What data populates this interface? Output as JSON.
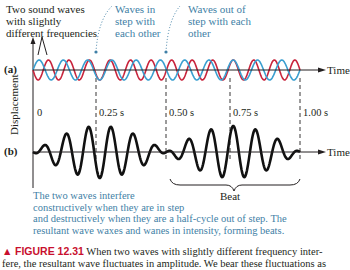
{
  "labels": {
    "two_waves": [
      "Two sound waves",
      "with slightly",
      "different frequencies"
    ],
    "in_step": [
      "Waves in",
      "step with",
      "each other"
    ],
    "out_of_step": [
      "Waves out of",
      "step with each",
      "other"
    ],
    "panel_a": "(a)",
    "panel_b": "(b)",
    "y_axis": "Displacement",
    "time_a": "Time",
    "time_b": "Time",
    "beat": "Beat",
    "ticks": [
      "0",
      "0.25 s",
      "0.50 s",
      "0.75 s",
      "1.00 s"
    ],
    "explanation": [
      "The two waves interfere",
      "constructively when they are in step",
      "and destructively when they are a half-cycle out of step.  The",
      "resultant wave waxes and wanes in intensity, forming beats."
    ]
  },
  "caption": {
    "marker": "▲",
    "figure_label": "FIGURE 12.31",
    "text_line1": "When two waves with slightly different frequency inter-",
    "text_line2": "fere, the resultant wave fluctuates in amplitude. We bear these fluctuations as"
  },
  "colors": {
    "wave_red": "#c8243c",
    "wave_blue": "#3a9fd0",
    "resultant": "#111111",
    "annotation_blue": "#3f7fa6",
    "figure_red": "#c8102e"
  }
}
